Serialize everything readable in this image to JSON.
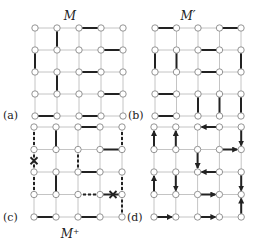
{
  "figure": {
    "panels": [
      {
        "id": "a",
        "label": "(a)",
        "title": "M",
        "grid": {
          "cols": 5,
          "rows": 5
        },
        "edges": [
          {
            "from": [
              0,
              2
            ],
            "to": [
              0,
              3
            ],
            "style": "solid"
          },
          {
            "from": [
              0,
              1
            ],
            "to": [
              1,
              1
            ],
            "style": "solid"
          },
          {
            "from": [
              1,
              3
            ],
            "to": [
              1,
              4
            ],
            "style": "solid"
          },
          {
            "from": [
              1,
              0
            ],
            "to": [
              2,
              0
            ],
            "style": "solid"
          },
          {
            "from": [
              2,
              2
            ],
            "to": [
              2,
              3
            ],
            "style": "solid"
          },
          {
            "from": [
              2,
              1
            ],
            "to": [
              3,
              1
            ],
            "style": "solid"
          },
          {
            "from": [
              3,
              3
            ],
            "to": [
              3,
              4
            ],
            "style": "solid"
          },
          {
            "from": [
              4,
              0
            ],
            "to": [
              4,
              1
            ],
            "style": "solid"
          },
          {
            "from": [
              4,
              2
            ],
            "to": [
              4,
              3
            ],
            "style": "solid"
          }
        ]
      },
      {
        "id": "b",
        "label": "(b)",
        "title": "M′",
        "grid": {
          "cols": 5,
          "rows": 5
        },
        "edges": [
          {
            "from": [
              0,
              0
            ],
            "to": [
              0,
              1
            ],
            "style": "solid"
          },
          {
            "from": [
              0,
              3
            ],
            "to": [
              0,
              4
            ],
            "style": "solid"
          },
          {
            "from": [
              1,
              2
            ],
            "to": [
              1,
              3
            ],
            "style": "solid"
          },
          {
            "from": [
              1,
              0
            ],
            "to": [
              2,
              0
            ],
            "style": "solid"
          },
          {
            "from": [
              1,
              1
            ],
            "to": [
              2,
              1
            ],
            "style": "solid"
          },
          {
            "from": [
              1,
              4
            ],
            "to": [
              2,
              4
            ],
            "style": "solid"
          },
          {
            "from": [
              2,
              2
            ],
            "to": [
              2,
              3
            ],
            "style": "solid"
          },
          {
            "from": [
              3,
              0
            ],
            "to": [
              3,
              1
            ],
            "style": "solid"
          },
          {
            "from": [
              3,
              2
            ],
            "to": [
              4,
              2
            ],
            "style": "solid"
          },
          {
            "from": [
              3,
              3
            ],
            "to": [
              4,
              3
            ],
            "style": "solid"
          },
          {
            "from": [
              3,
              4
            ],
            "to": [
              4,
              4
            ],
            "style": "solid"
          },
          {
            "from": [
              4,
              0
            ],
            "to": [
              4,
              1
            ],
            "style": "solid"
          }
        ]
      },
      {
        "id": "c",
        "label": "(c)",
        "title": "M⁺",
        "grid": {
          "cols": 5,
          "rows": 5
        },
        "edges": [
          {
            "from": [
              0,
              0
            ],
            "to": [
              1,
              0
            ],
            "style": "dashed"
          },
          {
            "from": [
              0,
              1
            ],
            "to": [
              1,
              1
            ],
            "style": "solid"
          },
          {
            "from": [
              0,
              2
            ],
            "to": [
              0,
              3
            ],
            "style": "solid"
          },
          {
            "from": [
              0,
              4
            ],
            "to": [
              1,
              4
            ],
            "style": "dashed"
          },
          {
            "from": [
              1,
              3
            ],
            "to": [
              1,
              4
            ],
            "style": "solid"
          },
          {
            "from": [
              1,
              0
            ],
            "to": [
              2,
              0
            ],
            "style": "dashed",
            "cross": true
          },
          {
            "from": [
              1,
              2
            ],
            "to": [
              2,
              2
            ],
            "style": "dashed"
          },
          {
            "from": [
              2,
              2
            ],
            "to": [
              2,
              3
            ],
            "style": "solid"
          },
          {
            "from": [
              2,
              0
            ],
            "to": [
              3,
              0
            ],
            "style": "dashed"
          },
          {
            "from": [
              2,
              1
            ],
            "to": [
              3,
              1
            ],
            "style": "solid"
          },
          {
            "from": [
              2,
              4
            ],
            "to": [
              3,
              4
            ],
            "style": "dashed"
          },
          {
            "from": [
              3,
              2
            ],
            "to": [
              3,
              3
            ],
            "style": "dashed"
          },
          {
            "from": [
              3,
              3
            ],
            "to": [
              3,
              4
            ],
            "style": "solid",
            "cross": true
          },
          {
            "from": [
              3,
              4
            ],
            "to": [
              4,
              4
            ],
            "style": "dashed"
          },
          {
            "from": [
              4,
              0
            ],
            "to": [
              4,
              1
            ],
            "style": "solid"
          },
          {
            "from": [
              4,
              2
            ],
            "to": [
              4,
              3
            ],
            "style": "solid"
          }
        ]
      },
      {
        "id": "d",
        "label": "(d)",
        "title": "",
        "grid": {
          "cols": 5,
          "rows": 5
        },
        "edges": [
          {
            "from": [
              1,
              0
            ],
            "to": [
              0,
              0
            ],
            "style": "arrow"
          },
          {
            "from": [
              1,
              1
            ],
            "to": [
              0,
              1
            ],
            "style": "arrow"
          },
          {
            "from": [
              0,
              3
            ],
            "to": [
              0,
              2
            ],
            "style": "arrow"
          },
          {
            "from": [
              0,
              4
            ],
            "to": [
              1,
              4
            ],
            "style": "arrow"
          },
          {
            "from": [
              1,
              3
            ],
            "to": [
              1,
              4
            ],
            "style": "arrow"
          },
          {
            "from": [
              1,
              2
            ],
            "to": [
              2,
              2
            ],
            "style": "arrow"
          },
          {
            "from": [
              2,
              3
            ],
            "to": [
              2,
              2
            ],
            "style": "arrow"
          },
          {
            "from": [
              3,
              0
            ],
            "to": [
              2,
              0
            ],
            "style": "arrow"
          },
          {
            "from": [
              2,
              1
            ],
            "to": [
              3,
              1
            ],
            "style": "arrow"
          },
          {
            "from": [
              2,
              4
            ],
            "to": [
              3,
              4
            ],
            "style": "arrow"
          },
          {
            "from": [
              3,
              2
            ],
            "to": [
              3,
              3
            ],
            "style": "arrow"
          },
          {
            "from": [
              4,
              4
            ],
            "to": [
              3,
              4
            ],
            "style": "arrow"
          },
          {
            "from": [
              4,
              0
            ],
            "to": [
              4,
              1
            ],
            "style": "arrow"
          },
          {
            "from": [
              4,
              2
            ],
            "to": [
              4,
              3
            ],
            "style": "arrow"
          }
        ]
      }
    ]
  }
}
